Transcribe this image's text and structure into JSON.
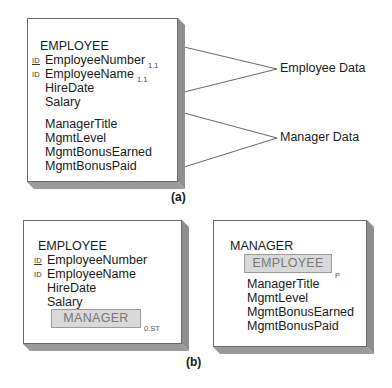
{
  "figure_a": {
    "label": "(a)",
    "entity": {
      "name": "EMPLOYEE",
      "attributes": [
        {
          "id_marker": "ID",
          "id_underlined": true,
          "name": "EmployeeNumber",
          "cardinality": "1.1"
        },
        {
          "id_marker": "ID",
          "id_underlined": false,
          "name": "EmployeeName",
          "cardinality": "1.1"
        },
        {
          "id_marker": "",
          "name": "HireDate",
          "cardinality": ""
        },
        {
          "id_marker": "",
          "name": "Salary",
          "cardinality": ""
        },
        {
          "id_marker": "",
          "name": "ManagerTitle",
          "cardinality": ""
        },
        {
          "id_marker": "",
          "name": "MgmtLevel",
          "cardinality": ""
        },
        {
          "id_marker": "",
          "name": "MgmtBonusEarned",
          "cardinality": ""
        },
        {
          "id_marker": "",
          "name": "MgmtBonusPaid",
          "cardinality": ""
        }
      ]
    },
    "annotations": [
      {
        "text": "Employee Data"
      },
      {
        "text": "Manager Data"
      }
    ]
  },
  "figure_b": {
    "label": "(b)",
    "supertype": {
      "name": "EMPLOYEE",
      "attributes": [
        {
          "id_marker": "ID",
          "id_underlined": true,
          "name": "EmployeeNumber"
        },
        {
          "id_marker": "ID",
          "id_underlined": false,
          "name": "EmployeeName"
        },
        {
          "id_marker": "",
          "name": "HireDate"
        },
        {
          "id_marker": "",
          "name": "Salary"
        }
      ],
      "subtype_group": {
        "name": "MANAGER",
        "cardinality": "0.ST"
      }
    },
    "subtype": {
      "name": "MANAGER",
      "supertype_ref": {
        "name": "EMPLOYEE",
        "marker": "P"
      },
      "attributes": [
        {
          "name": "ManagerTitle"
        },
        {
          "name": "MgmtLevel"
        },
        {
          "name": "MgmtBonusEarned"
        },
        {
          "name": "MgmtBonusPaid"
        }
      ]
    }
  },
  "colors": {
    "border": "#6a6a6a",
    "shadow": "#8e8e8e",
    "subtype_fill": "#d9d9d9",
    "subtype_text": "#777777",
    "text": "#1a1a1a"
  }
}
